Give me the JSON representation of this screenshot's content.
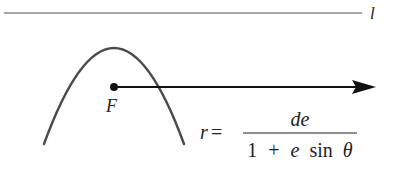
{
  "diagram": {
    "directrix": {
      "label": "l",
      "color": "#8a8a8a"
    },
    "parabola": {
      "color": "#4a4a4a",
      "opens": "down"
    },
    "focus": {
      "label": "F",
      "color": "#111111"
    },
    "ray": {
      "color": "#111111",
      "direction": "right"
    },
    "equation": {
      "lhs": "r",
      "equals": "=",
      "numerator": "de",
      "denominator_parts": {
        "one": "1",
        "plus": "+",
        "e": "e",
        "sin": "sin",
        "theta": "θ"
      },
      "full_text": "r = de / (1 + e sin θ)"
    }
  }
}
